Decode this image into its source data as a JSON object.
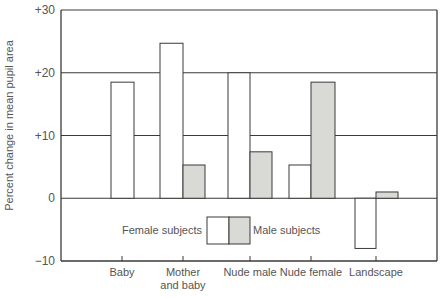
{
  "chart_data": {
    "type": "bar",
    "title": "",
    "xlabel": "",
    "ylabel": "Percent change in mean pupil area",
    "ylim": [
      -10,
      30
    ],
    "yticks": [
      {
        "value": 30,
        "label": "+30"
      },
      {
        "value": 20,
        "label": "+20"
      },
      {
        "value": 10,
        "label": "+10"
      },
      {
        "value": 0,
        "label": "0"
      },
      {
        "value": -10,
        "label": "−10"
      }
    ],
    "grid": true,
    "categories": [
      {
        "lines": [
          "Baby"
        ]
      },
      {
        "lines": [
          "Mother",
          "and baby"
        ]
      },
      {
        "lines": [
          "Nude male"
        ]
      },
      {
        "lines": [
          "Nude female"
        ]
      },
      {
        "lines": [
          "Landscape"
        ]
      }
    ],
    "series": [
      {
        "name": "Female subjects",
        "color": "#ffffff",
        "values": [
          18.5,
          24.7,
          20,
          5.3,
          -8
        ]
      },
      {
        "name": "Male subjects",
        "color": "#d9d9d6",
        "values": [
          null,
          5.3,
          7.4,
          18.5,
          1
        ]
      }
    ],
    "legend": {
      "position": "inside-bottom-center",
      "left_label": "Female subjects",
      "right_label": "Male subjects"
    }
  },
  "style": {
    "line_color": "#3a3a3a",
    "text_color": "#555555",
    "male_fill": "#d9d9d6",
    "female_fill": "#ffffff"
  }
}
